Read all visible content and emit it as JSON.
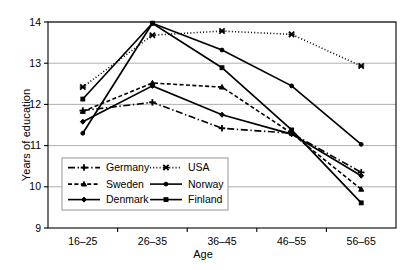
{
  "chart_data": {
    "type": "line",
    "title": "",
    "xlabel": "Age",
    "ylabel": "Years of education",
    "categories": [
      "16–25",
      "26–35",
      "36–45",
      "46–55",
      "56–65"
    ],
    "ylim": [
      9,
      14
    ],
    "yticks": [
      "9",
      "10",
      "11",
      "12",
      "13",
      "14"
    ],
    "grid": true,
    "legend_position": "lower-left-inside",
    "series": [
      {
        "name": "Germany",
        "marker": "plus",
        "dash": "dash-dot",
        "values": [
          11.85,
          12.05,
          11.42,
          11.3,
          10.35
        ]
      },
      {
        "name": "USA",
        "marker": "cross-x",
        "dash": "dotted",
        "values": [
          12.42,
          13.68,
          13.78,
          13.7,
          12.93
        ]
      },
      {
        "name": "Sweden",
        "marker": "triangle",
        "dash": "dashed",
        "values": [
          11.83,
          12.52,
          12.42,
          11.3,
          9.94
        ]
      },
      {
        "name": "Norway",
        "marker": "circle",
        "dash": "solid",
        "values": [
          11.3,
          13.97,
          13.32,
          12.45,
          11.03
        ]
      },
      {
        "name": "Denmark",
        "marker": "diamond",
        "dash": "solid",
        "values": [
          11.58,
          12.45,
          11.75,
          11.28,
          10.27
        ]
      },
      {
        "name": "Finland",
        "marker": "square",
        "dash": "solid",
        "values": [
          12.13,
          13.97,
          12.89,
          11.38,
          9.61
        ]
      }
    ],
    "legend_entries": [
      {
        "label": "Germany",
        "marker": "plus",
        "dash": "dash-dot"
      },
      {
        "label": "USA",
        "marker": "cross-x",
        "dash": "dotted"
      },
      {
        "label": "Sweden",
        "marker": "triangle",
        "dash": "dashed"
      },
      {
        "label": "Norway",
        "marker": "circle",
        "dash": "solid"
      },
      {
        "label": "Denmark",
        "marker": "diamond",
        "dash": "solid"
      },
      {
        "label": "Finland",
        "marker": "square",
        "dash": "solid"
      }
    ]
  },
  "colors": {
    "ink": "#000000",
    "grid": "#9a9a9a",
    "background": "#ffffff"
  }
}
